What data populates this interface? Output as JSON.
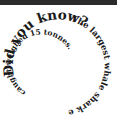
{
  "topbar": {
    "color": "#2b2b2b"
  },
  "spiral": {
    "heading": "Did you know?",
    "outer_text": "The largest whale shark ever",
    "inner_text": "caught weighed 15 tonnes.",
    "full_text": "Did you know? The largest whale shark ever caught weighed 15 tonnes.",
    "text_color": "#1a1a1a",
    "background": "#ffffff"
  }
}
